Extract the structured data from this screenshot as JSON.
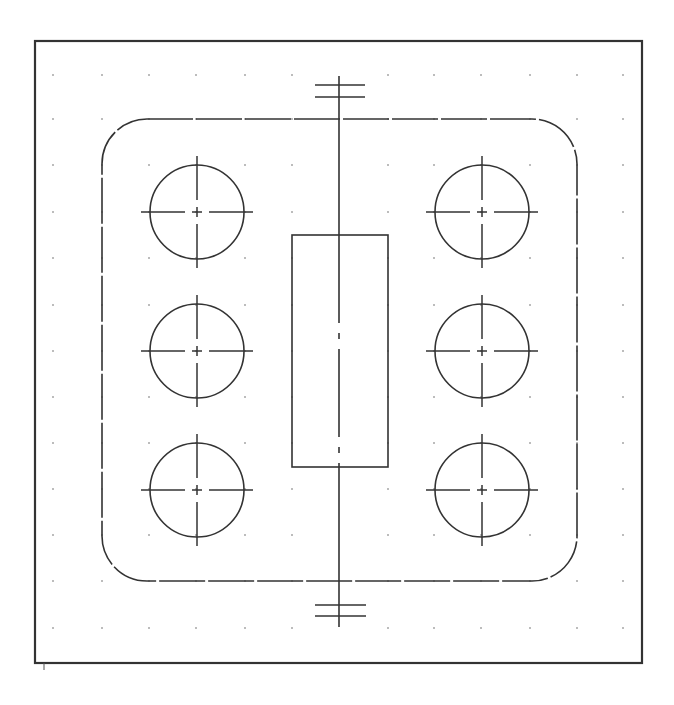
{
  "drawing": {
    "type": "CAD sheet",
    "stroke_color": "#333333",
    "grid_color": "#777777",
    "background": "#ffffff",
    "border": {
      "x": 35,
      "y": 41,
      "width": 607,
      "height": 622
    },
    "grid": {
      "xs": [
        53,
        102,
        149,
        196,
        245,
        292,
        388,
        434,
        481,
        530,
        577,
        623
      ],
      "ys": [
        75,
        119,
        165,
        212,
        258,
        305,
        351,
        397,
        443,
        489,
        535,
        581,
        628
      ]
    },
    "outline": {
      "x": 102,
      "y": 119,
      "width": 475,
      "height": 462,
      "corner_radius": 45
    },
    "center_slot": {
      "x": 292,
      "y": 235,
      "width": 96,
      "height": 232
    },
    "axis": {
      "x": 339,
      "y1": 76,
      "y2": 627
    },
    "top_ticks": {
      "x1": 315,
      "x2": 365,
      "ys": [
        85,
        97
      ]
    },
    "bottom_ticks": {
      "x1": 315,
      "x2": 366,
      "ys": [
        605,
        616
      ]
    },
    "holes": [
      {
        "id": "hole-top-left",
        "cx": 197,
        "cy": 212,
        "r": 47
      },
      {
        "id": "hole-middle-left",
        "cx": 197,
        "cy": 351,
        "r": 47
      },
      {
        "id": "hole-bottom-left",
        "cx": 197,
        "cy": 490,
        "r": 47
      },
      {
        "id": "hole-top-right",
        "cx": 482,
        "cy": 212,
        "r": 47
      },
      {
        "id": "hole-middle-right",
        "cx": 482,
        "cy": 351,
        "r": 47
      },
      {
        "id": "hole-bottom-right",
        "cx": 482,
        "cy": 490,
        "r": 47
      }
    ]
  }
}
